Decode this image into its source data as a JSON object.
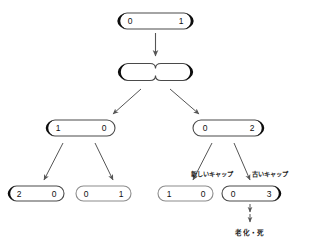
{
  "diagram": {
    "kind": "cell-division-telomere-tree",
    "background_color": "#ffffff",
    "stroke_color": "#4a4a4a",
    "cap_dark_color": "#0d0d0d",
    "cap_light_color": "#8c8c8c",
    "arrow_color": "#555555",
    "text_color": "#111111",
    "nodes": [
      {
        "id": "root",
        "left_value": "0",
        "right_value": "1",
        "left_cap": "dark",
        "right_cap": "dark",
        "shape": "capsule",
        "row": 0
      },
      {
        "id": "dividing",
        "left_value": "",
        "right_value": "",
        "left_cap": "dark",
        "right_cap": "dark",
        "shape": "pinched-capsule",
        "row": 1
      },
      {
        "id": "mid-left",
        "left_value": "1",
        "right_value": "0",
        "left_cap": "dark",
        "right_cap": "light",
        "shape": "capsule",
        "row": 2
      },
      {
        "id": "mid-right",
        "left_value": "0",
        "right_value": "2",
        "left_cap": "light",
        "right_cap": "dark",
        "shape": "capsule",
        "row": 2
      },
      {
        "id": "leaf-1",
        "left_value": "2",
        "right_value": "0",
        "left_cap": "dark",
        "right_cap": "light",
        "shape": "capsule",
        "row": 3
      },
      {
        "id": "leaf-2",
        "left_value": "0",
        "right_value": "1",
        "left_cap": "light",
        "right_cap": "light",
        "shape": "capsule",
        "row": 3
      },
      {
        "id": "leaf-3",
        "left_value": "1",
        "right_value": "0",
        "left_cap": "light",
        "right_cap": "light",
        "shape": "capsule",
        "row": 3
      },
      {
        "id": "leaf-4",
        "left_value": "0",
        "right_value": "3",
        "left_cap": "light",
        "right_cap": "dark",
        "shape": "capsule",
        "row": 3
      }
    ],
    "annotations": {
      "new_cap_label": "新しいキャップ",
      "old_cap_label": "古いキャップ",
      "outcome_label": "老化・死"
    },
    "arrows": [
      {
        "id": "root-to-dividing",
        "style": "vertical"
      },
      {
        "id": "dividing-to-mid-left",
        "style": "diagonal-left"
      },
      {
        "id": "dividing-to-mid-right",
        "style": "diagonal-right"
      },
      {
        "id": "mid-left-to-leaf-1",
        "style": "diagonal-left"
      },
      {
        "id": "mid-left-to-leaf-2",
        "style": "diagonal-right"
      },
      {
        "id": "mid-right-to-leaf-3",
        "style": "diagonal-left"
      },
      {
        "id": "mid-right-to-leaf-4",
        "style": "diagonal-right"
      },
      {
        "id": "leaf-4-to-outcome-a",
        "style": "vertical-short"
      },
      {
        "id": "leaf-4-to-outcome-b",
        "style": "vertical-short"
      }
    ]
  }
}
